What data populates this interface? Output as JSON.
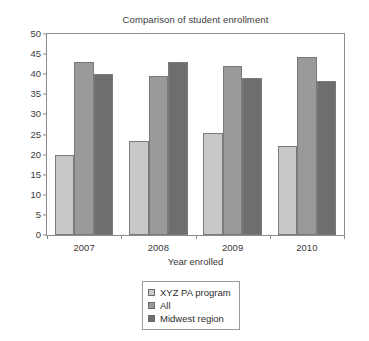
{
  "chart_data": {
    "type": "bar",
    "title": "Comparison of student enrollment",
    "xlabel": "Year enrolled",
    "ylabel": "",
    "categories": [
      "2007",
      "2008",
      "2009",
      "2010"
    ],
    "ylim": [
      0,
      50
    ],
    "yticks": [
      0,
      5,
      10,
      15,
      20,
      25,
      30,
      35,
      40,
      45,
      50
    ],
    "ytick_labels": [
      "0",
      "5",
      "10",
      "15",
      "20",
      "25",
      "30",
      "35",
      "40",
      "45",
      "50"
    ],
    "grid": false,
    "legend_position": "below-center",
    "series": [
      {
        "name": "XYZ PA program",
        "color": "#c8c8c8",
        "values": [
          20,
          23.4,
          25.4,
          22.2
        ]
      },
      {
        "name": "All",
        "color": "#9a9a9a",
        "values": [
          43,
          39.5,
          42,
          44.3
        ]
      },
      {
        "name": "Midwest region",
        "color": "#6e6e6e",
        "values": [
          40,
          43,
          39,
          38.3
        ]
      }
    ]
  },
  "colors": {
    "series_light": "#c8c8c8",
    "series_medium": "#9a9a9a",
    "series_dark": "#6e6e6e",
    "axis": "#8c8c8c",
    "text": "#3a3a3a",
    "background": "#ffffff"
  }
}
